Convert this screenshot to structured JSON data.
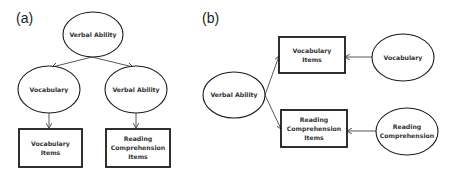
{
  "panels": [
    {
      "label": "(a)",
      "nodes": [
        {
          "id": "a_verbal_top",
          "type": "ellipse",
          "lines": [
            "Verbal Ability"
          ]
        },
        {
          "id": "a_vocab",
          "type": "ellipse",
          "lines": [
            "Vocabulary"
          ]
        },
        {
          "id": "a_verbal_mid",
          "type": "ellipse",
          "lines": [
            "Verbal Ability"
          ]
        },
        {
          "id": "a_vocab_items",
          "type": "box",
          "lines": [
            "Vocabulary",
            "Items"
          ]
        },
        {
          "id": "a_reading_items",
          "type": "box",
          "lines": [
            "Reading",
            "Comprehension",
            "Items"
          ]
        }
      ],
      "edges": [
        {
          "from": "a_verbal_top",
          "to": "a_vocab"
        },
        {
          "from": "a_verbal_top",
          "to": "a_verbal_mid"
        },
        {
          "from": "a_vocab",
          "to": "a_vocab_items"
        },
        {
          "from": "a_verbal_mid",
          "to": "a_reading_items"
        }
      ]
    },
    {
      "label": "(b)",
      "nodes": [
        {
          "id": "b_verbal",
          "type": "ellipse",
          "lines": [
            "Verbal Ability"
          ]
        },
        {
          "id": "b_vocab_items",
          "type": "box",
          "lines": [
            "Vocabulary",
            "Items"
          ]
        },
        {
          "id": "b_reading_items",
          "type": "box",
          "lines": [
            "Reading",
            "Comprehension",
            "Items"
          ]
        },
        {
          "id": "b_vocab",
          "type": "ellipse",
          "lines": [
            "Vocabulary"
          ]
        },
        {
          "id": "b_reading",
          "type": "ellipse",
          "lines": [
            "Reading",
            "Comprehension"
          ]
        }
      ],
      "edges": [
        {
          "from": "b_verbal",
          "to": "b_vocab_items"
        },
        {
          "from": "b_verbal",
          "to": "b_reading_items"
        },
        {
          "from": "b_vocab",
          "to": "b_vocab_items"
        },
        {
          "from": "b_reading",
          "to": "b_reading_items"
        }
      ]
    }
  ]
}
